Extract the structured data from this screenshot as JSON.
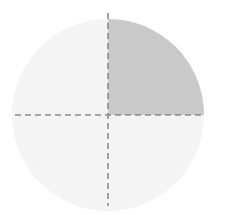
{
  "figure": {
    "canvas": {
      "width": 231,
      "height": 215,
      "background_color": "#ffffff"
    },
    "circle": {
      "name": "circle",
      "center_x": 108,
      "center_y": 115,
      "radius": 96,
      "fill_color": "#f4f4f4",
      "stroke_color": "none"
    },
    "shaded_sector": {
      "name": "upper-right-quadrant",
      "label": "1/4",
      "fraction": 0.25,
      "start_angle_deg": 0,
      "end_angle_deg": 90,
      "position": "upper-right",
      "fill_color": "#c9c9c9",
      "path": "M 108 115 L 204 115 A 96 96 0 0 0 108 19 Z"
    },
    "unshaded_sectors": [
      {
        "name": "upper-left-quadrant",
        "position": "upper-left",
        "fill_color": "#f4f4f4"
      },
      {
        "name": "lower-left-quadrant",
        "position": "lower-left",
        "fill_color": "#f4f4f4"
      },
      {
        "name": "lower-right-quadrant",
        "position": "lower-right",
        "fill_color": "#f4f4f4"
      }
    ],
    "divider_lines": [
      {
        "name": "vertical-divider",
        "orientation": "vertical",
        "x1": 108,
        "y1": 13,
        "x2": 108,
        "y2": 206,
        "stroke_color": "#8c8c8c",
        "stroke_width": 1.6,
        "dash_pattern": "6 4"
      },
      {
        "name": "horizontal-divider",
        "orientation": "horizontal",
        "x1": 15,
        "y1": 115,
        "x2": 201,
        "y2": 115,
        "stroke_color": "#8c8c8c",
        "stroke_width": 1.6,
        "dash_pattern": "6 4"
      }
    ]
  },
  "chart_data": {
    "type": "pie",
    "title": "",
    "subtitle": "",
    "xlabel": "",
    "ylabel": "",
    "categories": [
      "shaded",
      "unshaded"
    ],
    "values": [
      25,
      75
    ],
    "slices": [
      {
        "label": "shaded",
        "value": 25,
        "fraction": 0.25,
        "color": "#c9c9c9",
        "start_angle_deg": 0,
        "end_angle_deg": 90
      },
      {
        "label": "unshaded",
        "value": 75,
        "fraction": 0.75,
        "color": "#f4f4f4",
        "start_angle_deg": 90,
        "end_angle_deg": 360
      }
    ],
    "legend_position": "none",
    "grid": false,
    "annotations": []
  }
}
